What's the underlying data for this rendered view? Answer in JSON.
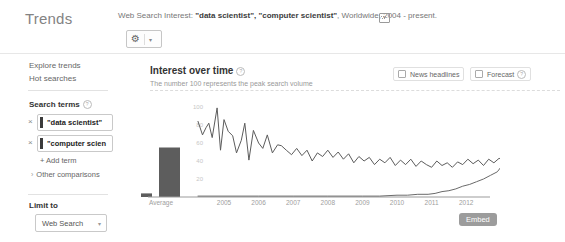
{
  "app": {
    "logo": "Trends"
  },
  "header": {
    "query_prefix": "Web Search Interest: ",
    "query_terms": "\"data scientist\", \"computer scientist\"",
    "query_suffix": ", Worldwide, 2004 - present.",
    "gear_icon": "gear",
    "caret": "▾"
  },
  "sidebar": {
    "links": [
      {
        "label": "Explore trends"
      },
      {
        "label": "Hot searches"
      }
    ],
    "search_terms": {
      "title": "Search terms",
      "terms": [
        {
          "label": "\"data scientist\"",
          "color": "#3b3b3b",
          "remove": "×"
        },
        {
          "label": "\"computer scien",
          "color": "#3b3b3b",
          "remove": "×"
        }
      ],
      "add_label": "+ Add term",
      "other_arrow": "›",
      "other_label": "Other comparisons"
    },
    "limit_to": {
      "title": "Limit to",
      "selected": "Web Search",
      "caret": "▾"
    }
  },
  "main": {
    "title": "Interest over time",
    "subtitle": "The number 100 represents the peak search volume",
    "checkboxes": [
      {
        "label": "News headlines"
      },
      {
        "label": "Forecast"
      }
    ],
    "embed_label": "Embed"
  },
  "chart_data": {
    "type": "line",
    "title": "Interest over time",
    "note": "The number 100 represents the peak search volume",
    "ylim": [
      0,
      100
    ],
    "yticks": [
      20,
      40,
      60,
      80,
      100
    ],
    "xticks": [
      2005,
      2006,
      2007,
      2008,
      2009,
      2010,
      2011,
      2012
    ],
    "average_label": "Average",
    "axis_color": "#9b9b9b",
    "bar_color": "#5d5d5d",
    "tick_color": "#9e9e9e",
    "ytick_color": "#c6c6c6",
    "averages": [
      {
        "name": "\"data scientist\"",
        "value": 4
      },
      {
        "name": "\"computer scientist\"",
        "value": 55
      }
    ],
    "series": [
      {
        "name": "\"computer scientist\"",
        "color": "#5c5c5c",
        "points": [
          [
            2004.25,
            84
          ],
          [
            2004.38,
            69
          ],
          [
            2004.48,
            77
          ],
          [
            2004.56,
            82
          ],
          [
            2004.66,
            66
          ],
          [
            2004.8,
            99
          ],
          [
            2004.9,
            52
          ],
          [
            2005.0,
            86
          ],
          [
            2005.12,
            73
          ],
          [
            2005.25,
            68
          ],
          [
            2005.36,
            49
          ],
          [
            2005.5,
            63
          ],
          [
            2005.6,
            82
          ],
          [
            2005.72,
            41
          ],
          [
            2005.85,
            74
          ],
          [
            2006.0,
            60
          ],
          [
            2006.12,
            54
          ],
          [
            2006.25,
            69
          ],
          [
            2006.4,
            49
          ],
          [
            2006.55,
            58
          ],
          [
            2006.66,
            57
          ],
          [
            2006.8,
            52
          ],
          [
            2006.95,
            47
          ],
          [
            2007.1,
            54
          ],
          [
            2007.25,
            46
          ],
          [
            2007.4,
            52
          ],
          [
            2007.55,
            40
          ],
          [
            2007.7,
            49
          ],
          [
            2007.85,
            45
          ],
          [
            2008.0,
            52
          ],
          [
            2008.15,
            44
          ],
          [
            2008.3,
            50
          ],
          [
            2008.45,
            42
          ],
          [
            2008.6,
            48
          ],
          [
            2008.75,
            38
          ],
          [
            2008.9,
            45
          ],
          [
            2009.05,
            40
          ],
          [
            2009.2,
            44
          ],
          [
            2009.35,
            36
          ],
          [
            2009.5,
            42
          ],
          [
            2009.65,
            38
          ],
          [
            2009.8,
            44
          ],
          [
            2009.95,
            35
          ],
          [
            2010.1,
            41
          ],
          [
            2010.25,
            36
          ],
          [
            2010.4,
            42
          ],
          [
            2010.55,
            34
          ],
          [
            2010.7,
            40
          ],
          [
            2010.85,
            36
          ],
          [
            2011.0,
            33
          ],
          [
            2011.15,
            40
          ],
          [
            2011.3,
            35
          ],
          [
            2011.45,
            38
          ],
          [
            2011.6,
            33
          ],
          [
            2011.75,
            39
          ],
          [
            2011.9,
            36
          ],
          [
            2012.05,
            42
          ],
          [
            2012.2,
            37
          ],
          [
            2012.35,
            41
          ],
          [
            2012.5,
            35
          ],
          [
            2012.65,
            42
          ],
          [
            2012.8,
            38
          ],
          [
            2012.95,
            43
          ],
          [
            2013.1,
            40
          ],
          [
            2013.22,
            53
          ]
        ]
      },
      {
        "name": "\"data scientist\"",
        "color": "#6a6a6a",
        "points": [
          [
            2004.25,
            1
          ],
          [
            2005.0,
            1
          ],
          [
            2006.0,
            1
          ],
          [
            2007.0,
            1
          ],
          [
            2008.0,
            1
          ],
          [
            2009.0,
            1
          ],
          [
            2009.5,
            1
          ],
          [
            2010.0,
            2
          ],
          [
            2010.3,
            2
          ],
          [
            2010.6,
            3
          ],
          [
            2010.9,
            3
          ],
          [
            2011.1,
            4
          ],
          [
            2011.3,
            6
          ],
          [
            2011.5,
            7
          ],
          [
            2011.7,
            9
          ],
          [
            2011.9,
            12
          ],
          [
            2012.1,
            14
          ],
          [
            2012.3,
            17
          ],
          [
            2012.5,
            20
          ],
          [
            2012.7,
            24
          ],
          [
            2012.9,
            28
          ],
          [
            2013.0,
            33
          ],
          [
            2013.08,
            38
          ],
          [
            2013.14,
            48
          ],
          [
            2013.18,
            41
          ],
          [
            2013.22,
            47
          ]
        ]
      }
    ]
  }
}
